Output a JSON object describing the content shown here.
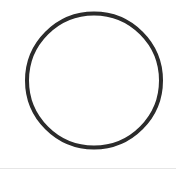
{
  "figure": {
    "shape": "circle",
    "cx": 94,
    "cy": 80.5,
    "r": 67,
    "stroke_width": 4,
    "stroke_color": "#2b2b2b",
    "fill": "#ffffff"
  },
  "background": "#ffffff"
}
